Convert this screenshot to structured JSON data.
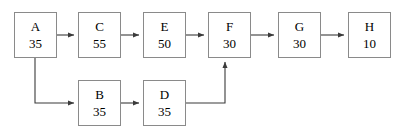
{
  "diagram": {
    "type": "flow-network",
    "width": 398,
    "height": 136,
    "style": {
      "box_border_color": "#8a8a8a",
      "edge_color": "#3b3b3b",
      "text_color": "#000000",
      "background": "#ffffff"
    },
    "nodes": [
      {
        "id": "A",
        "label": "A",
        "value": "35",
        "x": 14,
        "y": 12,
        "w": 43,
        "h": 46
      },
      {
        "id": "C",
        "label": "C",
        "value": "55",
        "x": 78,
        "y": 12,
        "w": 43,
        "h": 46
      },
      {
        "id": "E",
        "label": "E",
        "value": "50",
        "x": 143,
        "y": 12,
        "w": 43,
        "h": 46
      },
      {
        "id": "F",
        "label": "F",
        "value": "30",
        "x": 208,
        "y": 12,
        "w": 43,
        "h": 46
      },
      {
        "id": "G",
        "label": "G",
        "value": "30",
        "x": 278,
        "y": 12,
        "w": 43,
        "h": 46
      },
      {
        "id": "H",
        "label": "H",
        "value": "10",
        "x": 348,
        "y": 12,
        "w": 43,
        "h": 46
      },
      {
        "id": "B",
        "label": "B",
        "value": "35",
        "x": 78,
        "y": 80,
        "w": 43,
        "h": 46
      },
      {
        "id": "D",
        "label": "D",
        "value": "35",
        "x": 143,
        "y": 80,
        "w": 43,
        "h": 46
      }
    ],
    "edges": [
      {
        "id": "A-C",
        "from": "A",
        "to": "C",
        "arrow": true,
        "path": "M 57 35 L 74 35"
      },
      {
        "id": "C-E",
        "from": "C",
        "to": "E",
        "arrow": true,
        "path": "M 121 35 L 139 35"
      },
      {
        "id": "E-F",
        "from": "E",
        "to": "F",
        "arrow": true,
        "path": "M 186 35 L 204 35"
      },
      {
        "id": "F-G",
        "from": "F",
        "to": "G",
        "arrow": true,
        "path": "M 251 35 L 274 35"
      },
      {
        "id": "G-H",
        "from": "G",
        "to": "H",
        "arrow": true,
        "path": "M 321 35 L 344 35"
      },
      {
        "id": "A-B",
        "from": "A",
        "to": "B",
        "arrow": true,
        "path": "M 35 58 L 35 103 L 74 103"
      },
      {
        "id": "B-D",
        "from": "B",
        "to": "D",
        "arrow": true,
        "path": "M 121 103 L 139 103"
      },
      {
        "id": "D-F",
        "from": "D",
        "to": "F",
        "arrow": true,
        "path": "M 186 103 L 225 103 L 225 62"
      }
    ]
  }
}
